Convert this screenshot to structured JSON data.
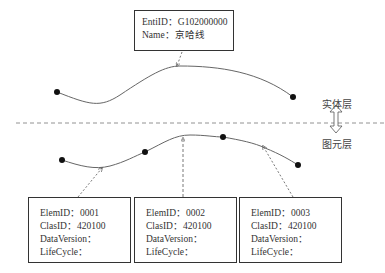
{
  "entity_layer": {
    "label": "实体层",
    "entity": {
      "entid_label": "EntiID：",
      "entid_value": "G102000000",
      "name_label": "Name：",
      "name_value": "京哈线"
    }
  },
  "element_layer": {
    "label": "图元层",
    "elements": [
      {
        "elemid_label": "ElemID：",
        "elemid_value": "0001",
        "clasid_label": "ClasID：",
        "clasid_value": "420100",
        "dataversion_label": "DataVersion：",
        "lifecycle_label": "LifeCycle："
      },
      {
        "elemid_label": "ElemID：",
        "elemid_value": "0002",
        "clasid_label": "ClasID：",
        "clasid_value": "420100",
        "dataversion_label": "DataVersion：",
        "lifecycle_label": "LifeCycle："
      },
      {
        "elemid_label": "ElemID：",
        "elemid_value": "0003",
        "clasid_label": "ClasID：",
        "clasid_value": "420100",
        "dataversion_label": "DataVersion：",
        "lifecycle_label": "LifeCycle："
      }
    ]
  },
  "colors": {
    "line": "#555555",
    "point": "#111111",
    "dash": "#777777"
  }
}
